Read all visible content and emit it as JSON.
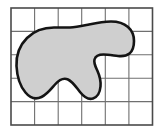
{
  "figure": {
    "background_color": "#ffffff"
  },
  "grid": {
    "name": "unit-square-grid",
    "columns": 6,
    "rows": 5,
    "x_left": 11,
    "y_top": 8,
    "x_right": 152.5,
    "y_bottom": 125,
    "cell_width": 23.58,
    "cell_height": 23.4,
    "line_color": "#6f6f6f",
    "border_color": "#4a4a4a",
    "line_width": 1.1,
    "border_width": 1.6,
    "x_lines": [
      11,
      34.6,
      58.2,
      81.7,
      105.3,
      128.9,
      152.5
    ],
    "y_lines": [
      8,
      31.4,
      54.8,
      78.2,
      101.6,
      125
    ]
  },
  "shape": {
    "name": "shaded-blob-region",
    "fill_color": "#cfcfcf",
    "stroke_color": "#141414",
    "stroke_width": 2.6,
    "path": "M 54 27.5 C 44 27.5 34 31 27 38 C 19.5 45.5 16 55 16.5 66 C 17 76 20 86 25.5 92.5 C 30 98 36 99.5 41.5 97 C 47 94.5 51 89 55 84.5 C 59 80 63.5 77.5 68 79.5 C 72.5 81.5 76 87 80 92 C 84 97 88.5 100 93 98.5 C 97.5 97 100 92 100.5 86.5 C 101 81 99.5 75.5 97.5 71 C 95.5 66.5 93.5 63 94.5 59.5 C 95.5 56 99 54.5 103.5 54.5 C 108 54.5 113.5 55.5 118 56 C 122.5 56.5 126.5 56 129.5 53.5 C 132.5 51 134 46.5 134 41 C 134 35.5 132 30.5 128 27 C 124 23.5 118 21.5 111 21.5 C 104 21.5 96 23 89 24.5 C 82 26 76 27.5 70 27.5 C 64 27.5 59 27.5 54 27.5 Z",
    "approx_area_squares": 13,
    "features": [
      "rounded-left-lobe",
      "flat-top-edge",
      "wavy-bottom-with-dip",
      "finger-protrusion-right",
      "s-curve-notch-lower-right"
    ]
  }
}
